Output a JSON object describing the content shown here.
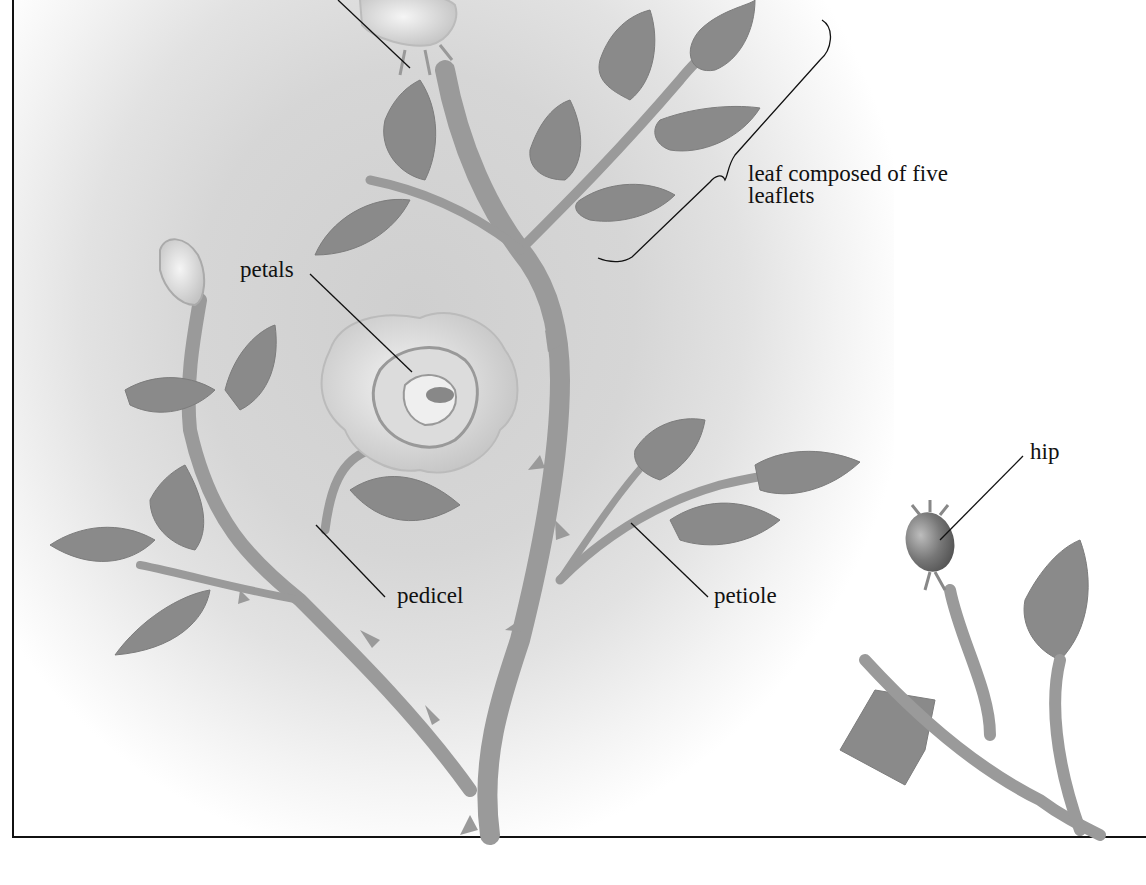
{
  "diagram": {
    "labels": {
      "leaf": "leaf composed of five leaflets",
      "petals": "petals",
      "pedicel": "pedicel",
      "petiole": "petiole",
      "hip": "hip"
    },
    "colors": {
      "leaf": "#8a8a8a",
      "stem": "#9a9a9a",
      "petal": "#e8e8e8",
      "hip": "#7a7a7a",
      "line": "#111111"
    }
  }
}
